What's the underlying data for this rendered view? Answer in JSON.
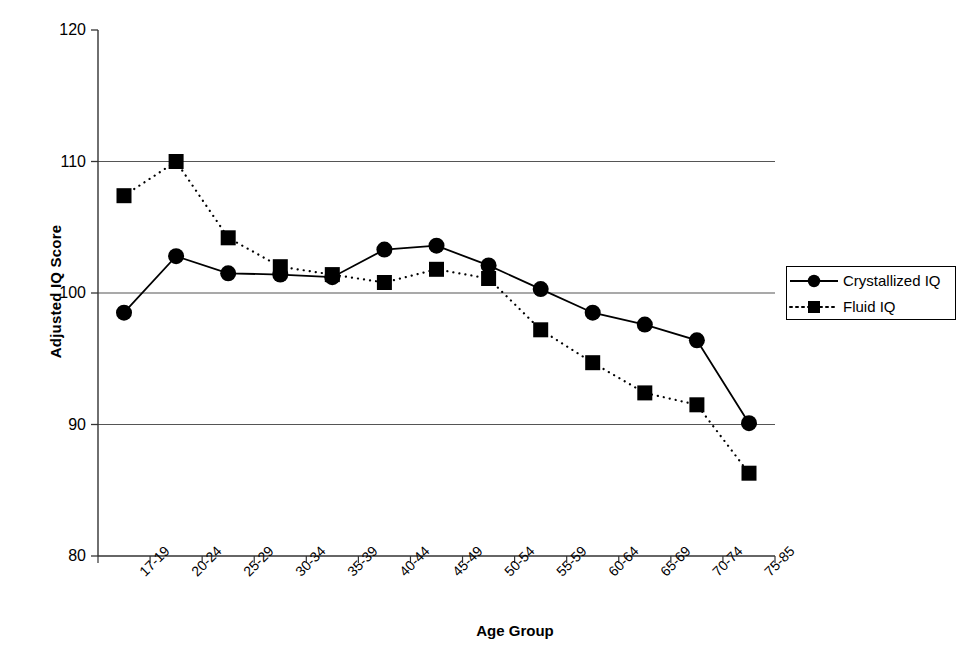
{
  "chart_data": {
    "type": "line",
    "title": "",
    "xlabel": "Age Group",
    "ylabel": "Adjusted IQ Score",
    "ylim": [
      80,
      120
    ],
    "yticks": [
      80,
      90,
      100,
      110,
      120
    ],
    "grid": "horizontal-at-90-100-110",
    "legend_position": "right-outside",
    "categories": [
      "17-19",
      "20-24",
      "25-29",
      "30-34",
      "35-39",
      "40-44",
      "45-49",
      "50-54",
      "55-59",
      "60-64",
      "65-69",
      "70-74",
      "75-85"
    ],
    "series": [
      {
        "name": "Crystallized IQ",
        "marker": "circle",
        "line": "solid",
        "color": "#000000",
        "values": [
          98.5,
          102.8,
          101.5,
          101.4,
          101.2,
          103.3,
          103.6,
          102.1,
          100.3,
          98.5,
          97.6,
          96.4,
          90.1
        ]
      },
      {
        "name": "Fluid IQ",
        "marker": "square",
        "line": "dotted",
        "color": "#000000",
        "values": [
          107.4,
          110.0,
          104.2,
          102.0,
          101.4,
          100.8,
          101.8,
          101.1,
          97.2,
          94.7,
          92.4,
          91.5,
          86.3
        ]
      }
    ]
  },
  "axes": {
    "y_tick_labels": [
      "120",
      "110",
      "100",
      "90",
      "80"
    ],
    "y_title": "Adjusted IQ Score",
    "x_title": "Age Group",
    "x_tick_labels": [
      "17-19",
      "20-24",
      "25-29",
      "30-34",
      "35-39",
      "40-44",
      "45-49",
      "50-54",
      "55-59",
      "60-64",
      "65-69",
      "70-74",
      "75-85"
    ]
  },
  "legend": {
    "entries": [
      {
        "label": "Crystallized IQ",
        "marker": "circle-marker",
        "style": "solid-line"
      },
      {
        "label": "Fluid IQ",
        "marker": "square-marker",
        "style": "dotted-line"
      }
    ]
  }
}
